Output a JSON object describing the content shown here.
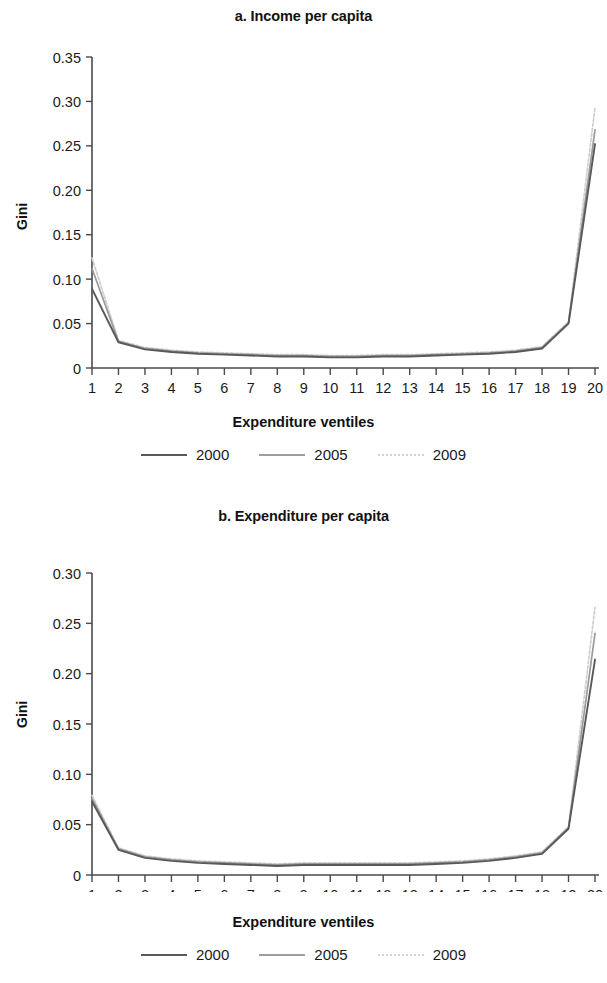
{
  "figure": {
    "panels": [
      {
        "id": "a",
        "title": "a. Income per capita",
        "ylabel": "Gini",
        "xlabel": "Expenditure ventiles"
      },
      {
        "id": "b",
        "title": "b. Expenditure per capita",
        "ylabel": "Gini",
        "xlabel": "Expenditure ventiles"
      }
    ],
    "legend": {
      "items": [
        {
          "label": "2000",
          "icon": "line-swatch-solid-dark",
          "color": "#595959"
        },
        {
          "label": "2005",
          "icon": "line-swatch-solid-gray",
          "color": "#9e9e9e"
        },
        {
          "label": "2009",
          "icon": "line-swatch-dotted-light",
          "color": "#d2d2d2"
        }
      ]
    }
  },
  "chart_data": [
    {
      "type": "line",
      "panel": "a",
      "title": "a. Income per capita",
      "xlabel": "Expenditure ventiles",
      "ylabel": "Gini",
      "categories": [
        1,
        2,
        3,
        4,
        5,
        6,
        7,
        8,
        9,
        10,
        11,
        12,
        13,
        14,
        15,
        16,
        17,
        18,
        19,
        20
      ],
      "x": [
        1,
        2,
        3,
        4,
        5,
        6,
        7,
        8,
        9,
        10,
        11,
        12,
        13,
        14,
        15,
        16,
        17,
        18,
        19,
        20
      ],
      "xlim": [
        1,
        20
      ],
      "ylim": [
        0,
        0.35
      ],
      "yticks": [
        "0",
        "0.05",
        "0.10",
        "0.15",
        "0.20",
        "0.25",
        "0.30",
        "0.35"
      ],
      "ytick_values": [
        0,
        0.05,
        0.1,
        0.15,
        0.2,
        0.25,
        0.3,
        0.35
      ],
      "xticks": [
        "1",
        "2",
        "3",
        "4",
        "5",
        "6",
        "7",
        "8",
        "9",
        "10",
        "11",
        "12",
        "13",
        "14",
        "15",
        "16",
        "17",
        "18",
        "19",
        "20"
      ],
      "grid": false,
      "legend_position": "bottom",
      "series": [
        {
          "name": "2000",
          "color": "#595959",
          "style": "solid",
          "values": [
            0.089,
            0.029,
            0.021,
            0.018,
            0.016,
            0.015,
            0.014,
            0.013,
            0.013,
            0.012,
            0.012,
            0.013,
            0.013,
            0.014,
            0.015,
            0.016,
            0.018,
            0.022,
            0.05,
            0.252
          ]
        },
        {
          "name": "2005",
          "color": "#9e9e9e",
          "style": "solid",
          "values": [
            0.112,
            0.03,
            0.022,
            0.019,
            0.017,
            0.016,
            0.015,
            0.014,
            0.014,
            0.013,
            0.013,
            0.014,
            0.014,
            0.015,
            0.016,
            0.017,
            0.019,
            0.023,
            0.051,
            0.268
          ]
        },
        {
          "name": "2009",
          "color": "#d2d2d2",
          "style": "dotted",
          "values": [
            0.124,
            0.031,
            0.023,
            0.02,
            0.018,
            0.017,
            0.016,
            0.015,
            0.015,
            0.014,
            0.014,
            0.015,
            0.015,
            0.016,
            0.017,
            0.018,
            0.02,
            0.024,
            0.052,
            0.293
          ]
        }
      ]
    },
    {
      "type": "line",
      "panel": "b",
      "title": "b. Expenditure per capita",
      "xlabel": "Expenditure ventiles",
      "ylabel": "Gini",
      "categories": [
        1,
        2,
        3,
        4,
        5,
        6,
        7,
        8,
        9,
        10,
        11,
        12,
        13,
        14,
        15,
        16,
        17,
        18,
        19,
        20
      ],
      "x": [
        1,
        2,
        3,
        4,
        5,
        6,
        7,
        8,
        9,
        10,
        11,
        12,
        13,
        14,
        15,
        16,
        17,
        18,
        19,
        20
      ],
      "xlim": [
        1,
        20
      ],
      "ylim": [
        0,
        0.3
      ],
      "yticks": [
        "0",
        "0.05",
        "0.10",
        "0.15",
        "0.20",
        "0.25",
        "0.30"
      ],
      "ytick_values": [
        0,
        0.05,
        0.1,
        0.15,
        0.2,
        0.25,
        0.3
      ],
      "xticks": [
        "1",
        "2",
        "3",
        "4",
        "5",
        "6",
        "7",
        "8",
        "9",
        "10",
        "11",
        "12",
        "13",
        "14",
        "15",
        "16",
        "17",
        "18",
        "19",
        "20"
      ],
      "grid": false,
      "legend_position": "bottom",
      "series": [
        {
          "name": "2000",
          "color": "#595959",
          "style": "solid",
          "values": [
            0.073,
            0.025,
            0.017,
            0.014,
            0.012,
            0.011,
            0.01,
            0.009,
            0.01,
            0.01,
            0.01,
            0.01,
            0.01,
            0.011,
            0.012,
            0.014,
            0.017,
            0.021,
            0.046,
            0.214
          ]
        },
        {
          "name": "2005",
          "color": "#9e9e9e",
          "style": "solid",
          "values": [
            0.076,
            0.026,
            0.018,
            0.015,
            0.013,
            0.012,
            0.011,
            0.01,
            0.011,
            0.011,
            0.011,
            0.011,
            0.011,
            0.012,
            0.013,
            0.015,
            0.018,
            0.022,
            0.047,
            0.24
          ]
        },
        {
          "name": "2009",
          "color": "#d2d2d2",
          "style": "dotted",
          "values": [
            0.079,
            0.027,
            0.019,
            0.016,
            0.014,
            0.013,
            0.012,
            0.011,
            0.012,
            0.012,
            0.012,
            0.012,
            0.012,
            0.013,
            0.014,
            0.016,
            0.019,
            0.023,
            0.048,
            0.266
          ]
        }
      ]
    }
  ]
}
